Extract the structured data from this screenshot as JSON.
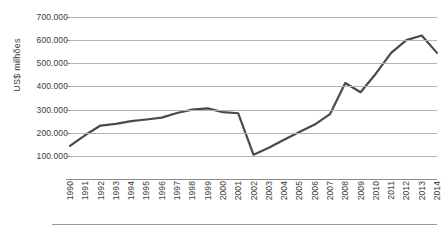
{
  "chart_data": {
    "type": "line",
    "title": "",
    "xlabel": "",
    "ylabel": "US$ milhões",
    "ylim": [
      0,
      700000
    ],
    "ytick_step": 100000,
    "grid": true,
    "legend": "none",
    "line_color": "#4a4a4a",
    "grid_color": "#b3b3b3",
    "axis_color": "#8c8c8c",
    "ytick_labels": [
      "700.000",
      "600.000",
      "500.000",
      "400.000",
      "300.000",
      "200.000",
      "100.000",
      ""
    ],
    "ytick_values": [
      700000,
      600000,
      500000,
      400000,
      300000,
      200000,
      100000,
      0
    ],
    "categories": [
      "1990",
      "1991",
      "1992",
      "1993",
      "1994",
      "1995",
      "1996",
      "1997",
      "1998",
      "1999",
      "2000",
      "2001",
      "2002",
      "2003",
      "2004",
      "2005",
      "2006",
      "2007",
      "2008",
      "2009",
      "2010",
      "2011",
      "2012",
      "2013",
      "2014"
    ],
    "values": [
      143000,
      190000,
      231000,
      238000,
      250000,
      257000,
      265000,
      285000,
      300000,
      305000,
      289000,
      284000,
      105000,
      135000,
      170000,
      203000,
      235000,
      280000,
      415000,
      375000,
      455000,
      545000,
      600000,
      620000,
      545000
    ]
  }
}
